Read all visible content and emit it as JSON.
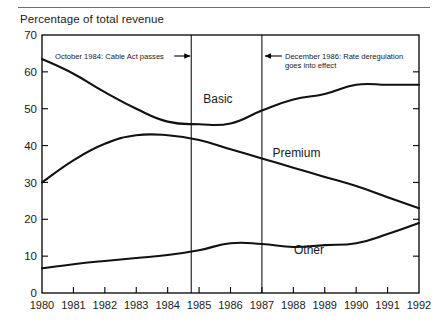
{
  "figure": {
    "top_rule": true,
    "axis_title": "Percentage of total revenue"
  },
  "chart_data": {
    "type": "line",
    "title": "Percentage of total revenue",
    "xlabel": "",
    "ylabel": "Percentage of total revenue",
    "x": [
      1980,
      1981,
      1982,
      1983,
      1984,
      1985,
      1986,
      1987,
      1988,
      1989,
      1990,
      1991,
      1992
    ],
    "categories": [
      "1980",
      "1981",
      "1982",
      "1983",
      "1984",
      "1985",
      "1986",
      "1987",
      "1988",
      "1989",
      "1990",
      "1991",
      "1992"
    ],
    "xlim": [
      1980,
      1992
    ],
    "ylim": [
      0,
      70
    ],
    "yticks": [
      0,
      10,
      20,
      30,
      40,
      50,
      60,
      70
    ],
    "ytick_labels": [
      "0",
      "10",
      "20",
      "30",
      "40",
      "50",
      "60",
      "70"
    ],
    "grid": false,
    "legend": "inline-labels",
    "series": [
      {
        "name": "Basic",
        "label": "Basic",
        "label_x": 1985.6,
        "label_y": 51.5,
        "values": [
          63.5,
          59.5,
          54.5,
          50.0,
          46.5,
          45.8,
          46.0,
          49.5,
          52.5,
          54.0,
          56.5,
          56.5,
          56.5
        ]
      },
      {
        "name": "Premium",
        "label": "Premium",
        "label_x": 1988.1,
        "label_y": 37.0,
        "values": [
          30.0,
          36.0,
          40.5,
          42.8,
          42.8,
          41.5,
          39.0,
          36.5,
          34.0,
          31.5,
          29.0,
          26.0,
          23.0
        ]
      },
      {
        "name": "Other",
        "label": "Other",
        "label_x": 1988.5,
        "label_y": 10.6,
        "values": [
          6.7,
          7.8,
          8.7,
          9.5,
          10.3,
          11.6,
          13.5,
          13.3,
          12.5,
          13.0,
          13.5,
          16.0,
          19.0
        ]
      }
    ],
    "event_lines": [
      {
        "name": "cable-act",
        "x": 1984.75,
        "annotation": "October 1984: Cable Act passes",
        "arrow": "right"
      },
      {
        "name": "rate-deregulation",
        "x": 1987.0,
        "annotation_line1": "December 1986: Rate deregulation",
        "annotation_line2": "goes into effect",
        "arrow": "left"
      }
    ]
  },
  "annotations": {
    "cable_act": "October 1984: Cable Act passes",
    "dereg_line1": "December 1986: Rate deregulation",
    "dereg_line2": "goes into effect"
  }
}
